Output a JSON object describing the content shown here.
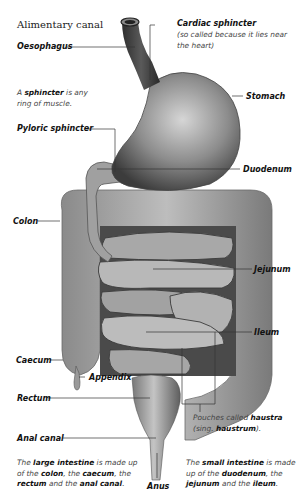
{
  "title": "Alimentary canal",
  "labels": {
    "oesophagus": "Oesophagus",
    "cardiac_sphincter": "Cardiac sphincter",
    "cardiac_note": "(so called because it lies near the heart)",
    "stomach": "Stomach",
    "pyloric_sphincter": "Pyloric sphincter",
    "duodenum": "Duodenum",
    "colon": "Colon",
    "jejunum": "Jejunum",
    "ileum": "Ileum",
    "caecum": "Caecum",
    "appendix": "Appendix",
    "rectum": "Rectum",
    "anal_canal": "Anal canal",
    "anus": "Anus"
  },
  "notes": {
    "sphincter": {
      "pre": "A ",
      "term": "sphincter",
      "post": " is any ring of muscle."
    },
    "haustra": {
      "pre": "Pouches called ",
      "term": "haustra",
      "mid": " (sing. ",
      "term2": "haustrum",
      "post": ")."
    },
    "large_intestine": {
      "p1": "The ",
      "t1": "large intestine",
      "p2": " is made up of the ",
      "t2": "colon",
      "p3": ", the ",
      "t3": "caecum",
      "p4": ", the ",
      "t4": "rectum",
      "p5": " and the ",
      "t5": "anal canal",
      "p6": "."
    },
    "small_intestine": {
      "p1": "The ",
      "t1": "small intestine",
      "p2": " is made up of the ",
      "t2": "duodenum",
      "p3": ", the ",
      "t3": "jejunum",
      "p4": " and the ",
      "t4": "ileum",
      "p5": "."
    }
  },
  "colors": {
    "organ_dark": "#3a3a3a",
    "organ_mid": "#8a8a8a",
    "organ_light": "#c8c8c8",
    "leader": "#333333"
  }
}
